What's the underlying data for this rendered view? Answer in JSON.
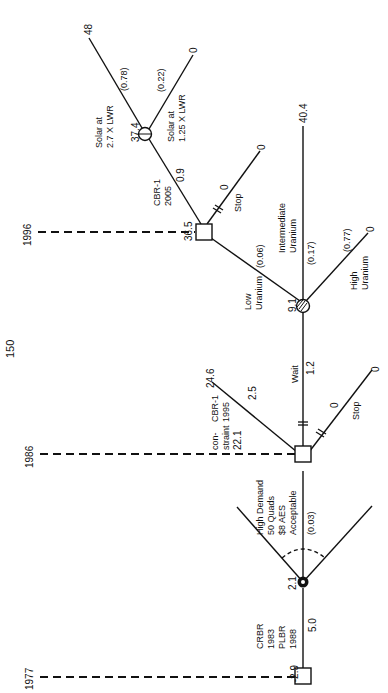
{
  "page": {
    "number": "150",
    "orientation": "rotated-landscape"
  },
  "timeline": [
    {
      "year": "1977",
      "value": "-2.9"
    },
    {
      "year": "1986",
      "value": "22.1"
    },
    {
      "year": "1996",
      "value": "36.5"
    }
  ],
  "nodes": {
    "start": {
      "type": "decision",
      "value": "-2.9",
      "label_lines": [
        "CRBR",
        "1983",
        "PLBR",
        "1988"
      ],
      "branch_cost": "5.0"
    },
    "demand": {
      "type": "chance",
      "value": "2.1",
      "label_lines": [
        "High Demand",
        "50 Quads",
        "$8 AES",
        "Acceptable"
      ],
      "probability": "(0.03)"
    },
    "decision_1986": {
      "type": "decision",
      "value": "22.1",
      "side_label_lines": [
        "con-",
        "straint"
      ]
    },
    "uranium": {
      "type": "chance",
      "value": "9.1"
    },
    "decision_1996": {
      "type": "decision",
      "value": "36.5"
    },
    "solar": {
      "type": "chance",
      "value": "37.4"
    }
  },
  "branches": {
    "cbr1_1995": {
      "label_lines": [
        "CBR-1",
        "1995"
      ],
      "cost": "2.5",
      "payoff": "24.6"
    },
    "wait": {
      "label": "Wait",
      "cost": "1.2"
    },
    "stop_1986": {
      "label": "Stop",
      "payoff": "0"
    },
    "low_uranium": {
      "label_lines": [
        "Low",
        "Uranium"
      ],
      "probability": "(0.06)"
    },
    "intermediate_uranium": {
      "label_lines": [
        "Intermediate",
        "Uranium"
      ],
      "probability": "(0.17)",
      "payoff": "40.4"
    },
    "high_uranium": {
      "label_lines": [
        "High",
        "Uranium"
      ],
      "probability": "(0.77)",
      "payoff": "0"
    },
    "cbr1_2005": {
      "label_lines": [
        "CBR-1",
        "2005"
      ],
      "cost": "0.9"
    },
    "stop_1996": {
      "label": "Stop",
      "payoff": "0"
    },
    "solar_27": {
      "label_lines": [
        "Solar at",
        "2.7 X LWR"
      ],
      "probability": "(0.78)",
      "payoff": "48"
    },
    "solar_125": {
      "label_lines": [
        "Solar at",
        "1.25 X LWR"
      ],
      "probability": "(0.22)",
      "payoff": "0"
    }
  }
}
